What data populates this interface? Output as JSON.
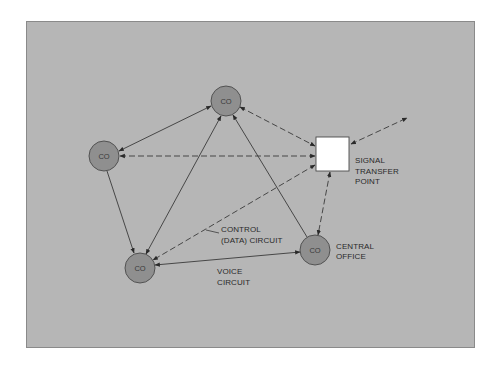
{
  "diagram": {
    "type": "network",
    "background_color": "#b6b6b6",
    "node_fill": "#8f8f8f",
    "stp_fill": "#ffffff",
    "nodes": [
      {
        "id": "co_top",
        "label": "CO",
        "x": 226,
        "y": 101,
        "r": 15
      },
      {
        "id": "co_left",
        "label": "CO",
        "x": 104,
        "y": 156,
        "r": 15
      },
      {
        "id": "co_bottom_left",
        "label": "CO",
        "x": 140,
        "y": 268,
        "r": 15
      },
      {
        "id": "co_right",
        "label": "CO",
        "x": 315,
        "y": 250,
        "r": 15
      },
      {
        "id": "stp",
        "label": "",
        "x": 316,
        "y": 137,
        "w": 33,
        "h": 34
      }
    ],
    "labels": {
      "stp_label": [
        "SIGNAL",
        "TRANSFER",
        "POINT"
      ],
      "central_office_label": [
        "CENTRAL",
        "OFFICE"
      ],
      "control_label": [
        "CONTROL",
        "(DATA) CIRCUIT"
      ],
      "voice_label": [
        "VOICE",
        "CIRCUIT"
      ]
    },
    "edges": [
      {
        "from": "co_top",
        "to": "co_left",
        "style": "solid",
        "arrows": "both"
      },
      {
        "from": "co_top",
        "to": "co_bottom_left",
        "style": "solid",
        "arrows": "both"
      },
      {
        "from": "co_right",
        "to": "co_top",
        "style": "solid",
        "arrows": "end"
      },
      {
        "from": "co_left",
        "to": "co_bottom_left",
        "style": "solid",
        "arrows": "end"
      },
      {
        "from": "co_bottom_left",
        "to": "co_right",
        "style": "solid",
        "arrows": "both"
      },
      {
        "from": "co_top",
        "to": "stp",
        "style": "dashed",
        "arrows": "both"
      },
      {
        "from": "stp",
        "to": "co_left",
        "style": "dashed",
        "arrows": "both"
      },
      {
        "from": "stp",
        "to": "co_bottom_left",
        "style": "dashed",
        "arrows": "both"
      },
      {
        "from": "stp",
        "to": "co_right",
        "style": "dashed",
        "arrows": "both"
      },
      {
        "from": "stp",
        "to": "offpage",
        "style": "dashed",
        "arrows": "both"
      }
    ]
  }
}
